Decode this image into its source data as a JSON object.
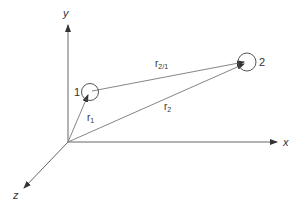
{
  "diagram": {
    "colors": {
      "line": "#666666",
      "text": "#333333",
      "background": "#ffffff"
    },
    "axes": {
      "y": {
        "label": "y"
      },
      "x": {
        "label": "x"
      },
      "z": {
        "label": "z"
      }
    },
    "points": [
      {
        "label": "1"
      },
      {
        "label": "2"
      }
    ],
    "vectors": [
      {
        "name": "r",
        "sub": "1"
      },
      {
        "name": "r",
        "sub": "2"
      },
      {
        "name": "r",
        "sub": "2/1"
      }
    ]
  }
}
